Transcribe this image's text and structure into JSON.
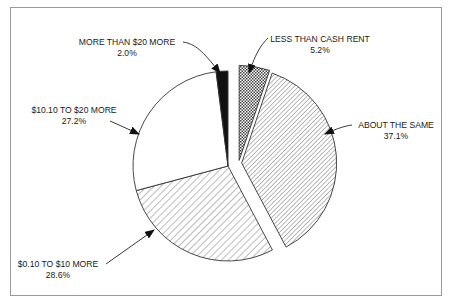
{
  "chart_data": {
    "type": "pie",
    "title": "",
    "slices": [
      {
        "label": "LESS THAN CASH RENT",
        "value": 5.2,
        "value_label": "5.2%",
        "pattern": "crosshatch",
        "exploded": true
      },
      {
        "label": "ABOUT THE SAME",
        "value": 37.1,
        "value_label": "37.1%",
        "pattern": "fine-diagonal",
        "exploded": true
      },
      {
        "label": "$0.10 TO $10 MORE",
        "value": 28.6,
        "value_label": "28.6%",
        "pattern": "wide-diagonal",
        "exploded": false
      },
      {
        "label": "$10.10 TO $20 MORE",
        "value": 27.2,
        "value_label": "27.2%",
        "pattern": "none",
        "exploded": false
      },
      {
        "label": "MORE THAN $20 MORE",
        "value": 2.0,
        "value_label": "2.0%",
        "pattern": "solid-black",
        "exploded": false
      }
    ],
    "start_angle": "12 o'clock",
    "direction": "clockwise",
    "legend": "none (callout labels with arrows)"
  },
  "colors": {
    "stroke": "#333333",
    "solid": "#111111",
    "background": "#ffffff",
    "frame": "#9a9a9a"
  }
}
